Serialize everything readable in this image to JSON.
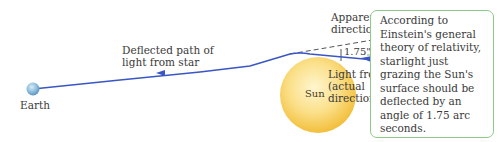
{
  "diagram": {
    "labels": {
      "earth": "Earth",
      "sun": "Sun",
      "deflected_path": "Deflected path of\nlight from star",
      "apparent_direction": "Apparent\ndirection to star",
      "light_from_star": "Light from star\n(actual\ndirection)",
      "angle": "1.75\""
    },
    "callout": {
      "text": "According to\nEinstein's general\ntheory of relativity,\nstarlight just\ngrazing the Sun's\nsurface should be\ndeflected by an\nangle of 1.75 arc\nseconds."
    },
    "colors": {
      "light_path": "#3a56c4",
      "dashed_line": "#555555",
      "sun_outer": "#f5c84a",
      "sun_inner": "#fdeeb0",
      "earth": "#7fb3d8",
      "callout_border": "#8fc98a"
    },
    "objects": [
      {
        "name": "Earth",
        "shape": "small sphere"
      },
      {
        "name": "Sun",
        "shape": "large sphere"
      }
    ]
  }
}
